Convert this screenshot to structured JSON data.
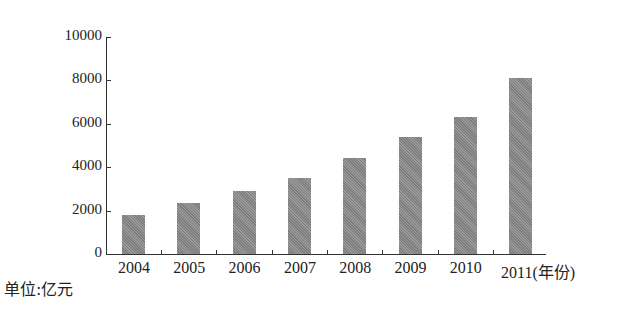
{
  "chart_data": {
    "type": "bar",
    "title": "",
    "categories": [
      "2004",
      "2005",
      "2006",
      "2007",
      "2008",
      "2009",
      "2010",
      "2011"
    ],
    "values": [
      1800,
      2350,
      2900,
      3500,
      4420,
      5390,
      6310,
      8100
    ],
    "xlabel": "(年份)",
    "ylabel": "单位:亿元",
    "ylim": [
      0,
      10000
    ],
    "yticks": [
      "0",
      "2000",
      "4000",
      "6000",
      "8000",
      "10000"
    ],
    "grid": false,
    "legend": null,
    "bar_color": "#8c8c8c"
  },
  "labels": {
    "x_last": "2011(年份)",
    "unit": "单位:亿元"
  }
}
